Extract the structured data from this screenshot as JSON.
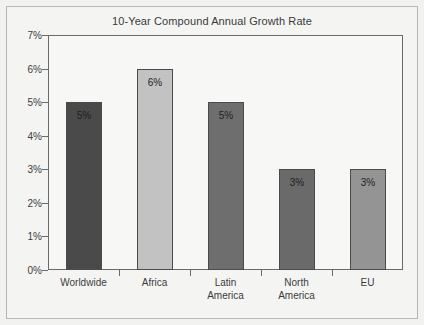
{
  "chart_data": {
    "type": "bar",
    "title": "10-Year Compound Annual Growth Rate",
    "xlabel": "",
    "ylabel": "",
    "categories": [
      "Worldwide",
      "Africa",
      "Latin\nAmerica",
      "North\nAmerica",
      "EU"
    ],
    "values": [
      5,
      6,
      5,
      3,
      3
    ],
    "data_labels": [
      "5%",
      "6%",
      "5%",
      "3%",
      "3%"
    ],
    "ylim": [
      0,
      7
    ],
    "ytick_values": [
      0,
      1,
      2,
      3,
      4,
      5,
      6,
      7
    ],
    "ytick_labels": [
      "0%",
      "1%",
      "2%",
      "3%",
      "4%",
      "5%",
      "6%",
      "7%"
    ],
    "grid": false,
    "legend": false,
    "legend_position": "none",
    "bar_colors": [
      "#4a4a4a",
      "#c2c2c2",
      "#6e6e6e",
      "#6a6a6a",
      "#949494"
    ],
    "bar_border_color": "#4b4b4b",
    "axis_color": "#6a6a6a",
    "plot_background": "#f7f7f6",
    "figure_background": "#f2f2f1",
    "title_color": "#3a3a3a",
    "tick_label_color": "#3c3c3c"
  }
}
